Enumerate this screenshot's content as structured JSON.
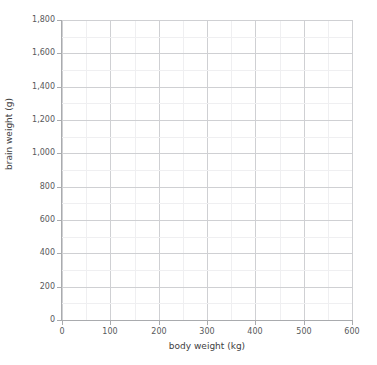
{
  "chart_data": {
    "type": "scatter",
    "title": "",
    "xlabel": "body weight (kg)",
    "ylabel": "brain weight (g)",
    "xlim": [
      0,
      600
    ],
    "ylim": [
      0,
      1800
    ],
    "x_major_step": 100,
    "x_minor_step": 50,
    "y_major_step": 200,
    "y_minor_step": 100,
    "grid": true,
    "legend": null,
    "x_tick_labels": [
      "0",
      "100",
      "200",
      "300",
      "400",
      "500",
      "600"
    ],
    "x_tick_values": [
      0,
      100,
      200,
      300,
      400,
      500,
      600
    ],
    "y_tick_labels": [
      "0",
      "200",
      "400",
      "600",
      "800",
      "1,000",
      "1,200",
      "1,400",
      "1,600",
      "1,800"
    ],
    "y_tick_values": [
      0,
      200,
      400,
      600,
      800,
      1000,
      1200,
      1400,
      1600,
      1800
    ],
    "series": [
      {
        "name": "",
        "points": []
      }
    ],
    "x": [],
    "values": [],
    "colors": {
      "plot_background": "#ffffff",
      "grid_major": "#cfd0d3",
      "grid_minor": "#efeff1",
      "axis_line": "#a9abae",
      "tick_label": "#58595b",
      "axis_title": "#414042"
    }
  }
}
